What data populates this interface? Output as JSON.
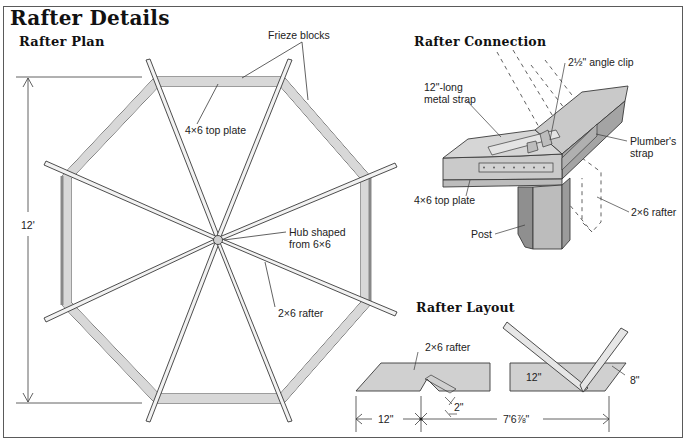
{
  "title": "Rafter Details",
  "colors": {
    "lumber_fill": "#d8d8d8",
    "lumber_dark": "#a8a8a8",
    "line": "#3a3a3a",
    "background": "#ffffff"
  },
  "rafter_plan": {
    "title": "Rafter Plan",
    "labels": {
      "frieze_blocks": "Frieze blocks",
      "top_plate": "4×6 top plate",
      "dimension": "12'",
      "hub_line1": "Hub shaped",
      "hub_line2": "from 6×6",
      "rafter": "2×6 rafter"
    }
  },
  "rafter_connection": {
    "title": "Rafter Connection",
    "labels": {
      "angle_clip": "2½\" angle clip",
      "strap_line1": "12\"-long",
      "strap_line2": "metal strap",
      "plumbers_line1": "Plumber's",
      "plumbers_line2": "strap",
      "top_plate": "4×6 top plate",
      "post": "Post",
      "rafter": "2×6 rafter"
    }
  },
  "rafter_layout": {
    "title": "Rafter Layout",
    "labels": {
      "rafter": "2×6 rafter",
      "square_12": "12\"",
      "square_8": "8\"",
      "dim_12": "12\"",
      "dim_2": "2\"",
      "dim_total": "7'6⅞\""
    }
  }
}
